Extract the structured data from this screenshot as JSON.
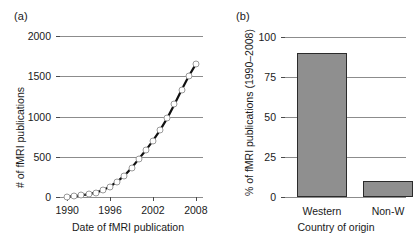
{
  "figure": {
    "panel_a_label": "(a)",
    "panel_b_label": "(b)"
  },
  "chart_data": [
    {
      "id": "panel-a",
      "type": "line",
      "title": "",
      "xlabel": "Date of fMRI publication",
      "ylabel": "# of fMRI publications",
      "xlim": [
        1989,
        2009
      ],
      "ylim": [
        0,
        2000
      ],
      "xticks": [
        1990,
        1996,
        2002,
        2008
      ],
      "xtick_labels": [
        "1990",
        "1996",
        "2002",
        "2008"
      ],
      "yticks": [
        0,
        500,
        1000,
        1500,
        2000
      ],
      "ytick_labels": [
        "0",
        "500",
        "1000",
        "1500",
        "2000"
      ],
      "grid": "horizontal",
      "legend": "none",
      "marker": "open-circle",
      "x": [
        1990,
        1991,
        1992,
        1993,
        1994,
        1995,
        1996,
        1997,
        1998,
        1999,
        2000,
        2001,
        2002,
        2003,
        2004,
        2005,
        2006,
        2007,
        2008
      ],
      "values": [
        5,
        10,
        20,
        35,
        55,
        85,
        130,
        190,
        265,
        360,
        470,
        580,
        700,
        830,
        980,
        1150,
        1330,
        1500,
        1650
      ],
      "note": "Right edge of the figure is cropped; the 2008 tick label renders partially."
    },
    {
      "id": "panel-b",
      "type": "bar",
      "title": "",
      "xlabel": "Country of origin",
      "ylabel": "% of fMRI publications (1990–2008)",
      "ylim": [
        0,
        100
      ],
      "yticks": [
        0,
        25,
        50,
        75,
        100
      ],
      "ytick_labels": [
        "0",
        "25",
        "50",
        "75",
        "100"
      ],
      "grid": "horizontal",
      "legend": "none",
      "categories": [
        "Western",
        "Non-Western"
      ],
      "category_labels_rendered": [
        "Western",
        "Non-W"
      ],
      "values": [
        90,
        10
      ],
      "bar_color": "#8f8f8f",
      "bar_edge_color": "#2b2b2b",
      "note": "Right edge of the figure is cropped; the Non-Western bar and its label are partially cut off."
    }
  ]
}
